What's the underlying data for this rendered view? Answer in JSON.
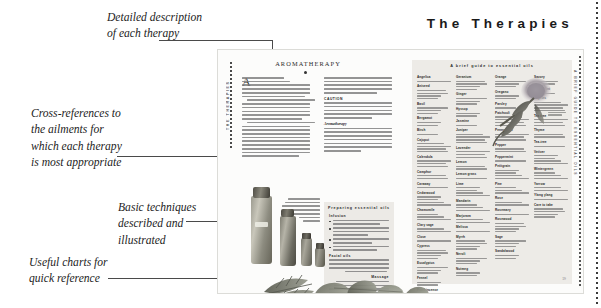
{
  "document": {
    "running_head": "The Therapies",
    "page_number": "19"
  },
  "callouts": [
    {
      "id": "detailed-description",
      "lines": [
        "Detailed description",
        "of each therapy"
      ]
    },
    {
      "id": "cross-references",
      "lines": [
        "Cross-references to",
        "the ailments for",
        "which each therapy",
        "is most appropriate"
      ]
    },
    {
      "id": "basic-techniques",
      "lines": [
        "Basic techniques",
        "described and",
        "illustrated"
      ]
    },
    {
      "id": "useful-charts",
      "lines": [
        "Useful charts for",
        "quick reference"
      ]
    }
  ],
  "spread": {
    "left_page": {
      "tab_label": "THE THERAPIES",
      "article_title": "AROMATHERAPY",
      "dropcap": "A",
      "sidebar_box": {
        "title": "Preparing essential oils",
        "subheads": [
          "Infusion",
          "Facial oils",
          "Massage"
        ]
      },
      "body_subheads": [
        "CAUTION",
        "Aromatherapy"
      ]
    },
    "right_page": {
      "tab_label": "A BRIEF GUIDE TO ESSENTIAL OILS",
      "chart_title": "A brief guide to essential oils",
      "oil_columns": [
        [
          "Angelica",
          "Aniseed",
          "Basil",
          "Bergamot",
          "Birch",
          "Cajuput",
          "Calendula",
          "Camphor",
          "Caraway",
          "Cedarwood",
          "Chamomile",
          "Clary sage",
          "Clove",
          "Cypress",
          "Eucalyptus",
          "Fennel",
          "Frankincense"
        ],
        [
          "Geranium",
          "Ginger",
          "Hyssop",
          "Jasmine",
          "Juniper",
          "Lavender",
          "Lemon",
          "Lemon grass",
          "Lime",
          "Mandarin",
          "Marjoram",
          "Melissa",
          "Myrrh",
          "Neroli",
          "Nutmeg"
        ],
        [
          "Orange",
          "Oregano",
          "Parsley",
          "Patchouli",
          "Pennyroyal",
          "Pepper",
          "Peppermint",
          "Petitgrain",
          "Pine",
          "Rose",
          "Rosemary",
          "Rosewood",
          "Sage",
          "Sandalwood"
        ],
        [
          "Savory",
          "Spearmint",
          "Tagetes",
          "Tea tree",
          "Thyme",
          "Tea-tree",
          "Vetiver",
          "Wintergreen",
          "Yarrow",
          "Ylang ylang",
          "Care to take"
        ]
      ]
    }
  },
  "colors": {
    "paper": "#fcfcfb",
    "panel": "#edebe7",
    "ink": "#1a1a1a",
    "rule": "#4a4a4a"
  }
}
